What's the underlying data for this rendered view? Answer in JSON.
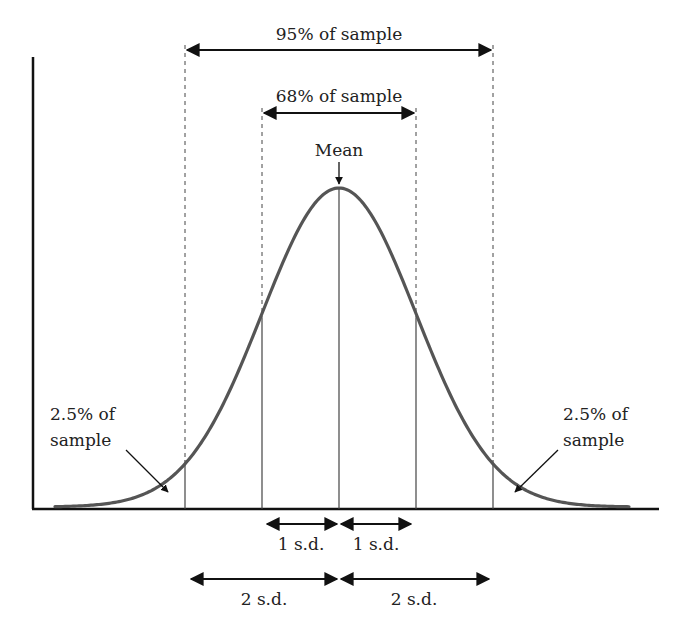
{
  "diagram": {
    "title_labels": {
      "range_95": "95% of sample",
      "range_68": "68% of sample",
      "mean": "Mean",
      "left_tail_line1": "2.5% of",
      "left_tail_line2": "sample",
      "right_tail_line1": "2.5% of",
      "right_tail_line2": "sample",
      "sd1_left": "1 s.d.",
      "sd1_right": "1 s.d.",
      "sd2_left": "2 s.d.",
      "sd2_right": "2 s.d."
    },
    "colors": {
      "curve": "#555555",
      "axis": "#111111",
      "text": "#222222",
      "guide_lines": "#444444"
    }
  },
  "chart_data": {
    "type": "line",
    "xlabel": "",
    "ylabel": "",
    "mean": 0,
    "sd": 1,
    "x_markers": [
      -2,
      -1,
      0,
      1,
      2
    ],
    "annotations": [
      {
        "text": "95% of sample",
        "from": -2,
        "to": 2
      },
      {
        "text": "68% of sample",
        "from": -1,
        "to": 1
      },
      {
        "text": "Mean",
        "at": 0
      },
      {
        "text": "2.5% of sample",
        "region": "left tail"
      },
      {
        "text": "2.5% of sample",
        "region": "right tail"
      },
      {
        "text": "1 s.d.",
        "from": -1,
        "to": 0
      },
      {
        "text": "1 s.d.",
        "from": 0,
        "to": 1
      },
      {
        "text": "2 s.d.",
        "from": -2,
        "to": 0
      },
      {
        "text": "2 s.d.",
        "from": 0,
        "to": 2
      }
    ],
    "grid": false,
    "legend": "none"
  }
}
